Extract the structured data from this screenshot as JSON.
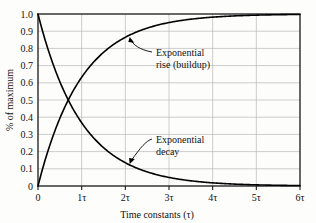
{
  "chart_data": {
    "type": "line",
    "title": "",
    "xlabel": "Time constants (τ)",
    "ylabel": "% of maximum",
    "xlim": [
      0,
      6
    ],
    "ylim": [
      0,
      1.0
    ],
    "grid": true,
    "legend_position": "inline-annotations",
    "x_tick_labels": [
      "0",
      "1τ",
      "2τ",
      "3τ",
      "4τ",
      "5τ",
      "6τ"
    ],
    "x_tick_values": [
      0,
      1,
      2,
      3,
      4,
      5,
      6
    ],
    "y_tick_labels": [
      "0",
      "0.1",
      "0.2",
      "0.3",
      "0.4",
      "0.5",
      "0.6",
      "0.7",
      "0.8",
      "0.9",
      "1.0"
    ],
    "y_tick_values": [
      0,
      0.1,
      0.2,
      0.3,
      0.4,
      0.5,
      0.6,
      0.7,
      0.8,
      0.9,
      1.0
    ],
    "series": [
      {
        "name": "Exponential rise (buildup)",
        "formula": "1 - e^(-t/tau)",
        "x": [
          0,
          0.25,
          0.5,
          0.75,
          1,
          1.25,
          1.5,
          1.75,
          2,
          2.5,
          3,
          3.5,
          4,
          4.5,
          5,
          5.5,
          6
        ],
        "values": [
          0.0,
          0.221,
          0.393,
          0.528,
          0.632,
          0.713,
          0.777,
          0.826,
          0.865,
          0.918,
          0.95,
          0.97,
          0.982,
          0.989,
          0.993,
          0.996,
          0.998
        ]
      },
      {
        "name": "Exponential decay",
        "formula": "e^(-t/tau)",
        "x": [
          0,
          0.25,
          0.5,
          0.75,
          1,
          1.25,
          1.5,
          1.75,
          2,
          2.5,
          3,
          3.5,
          4,
          4.5,
          5,
          5.5,
          6
        ],
        "values": [
          1.0,
          0.779,
          0.607,
          0.472,
          0.368,
          0.287,
          0.223,
          0.174,
          0.135,
          0.082,
          0.05,
          0.03,
          0.018,
          0.011,
          0.007,
          0.004,
          0.002
        ]
      }
    ],
    "crossing_point": {
      "x": 0.693,
      "y": 0.5
    },
    "annotations": [
      {
        "name": "rise-annotation",
        "line1": "Exponential",
        "line2": "rise (buildup)",
        "points_to": {
          "x": 2.1,
          "y": 0.875
        }
      },
      {
        "name": "decay-annotation",
        "line1": "Exponential",
        "line2": "decay",
        "points_to": {
          "x": 2.1,
          "y": 0.125
        }
      }
    ],
    "colors": {
      "curve": "#000000",
      "grid": "#b9b9b9",
      "frame": "#1a1a1a",
      "background": "#fdfdfc",
      "text": "#111111"
    }
  }
}
